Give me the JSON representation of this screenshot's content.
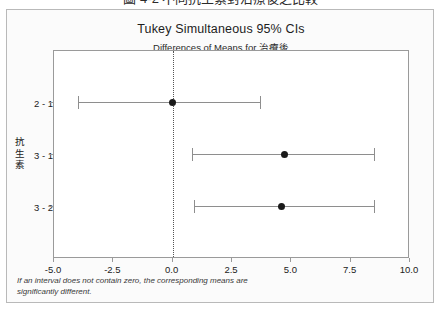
{
  "top_caption": "圖 4-2  不同抗生素對治療後之比較",
  "chart": {
    "title": "Tukey Simultaneous 95% CIs",
    "subtitle": "Differences of Means for 治療後",
    "y_axis_title": "抗生素",
    "footnote_line1": "If an interval does not contain zero, the corresponding means are",
    "footnote_line2": "significantly different.",
    "colors": {
      "point": "#1a1a1a",
      "interval": "#8e8e8e",
      "frame": "#9a9a9a",
      "zero_line": "#555555",
      "panel_background": "#fbfbfb"
    }
  },
  "chart_data": {
    "type": "scatter",
    "title": "Tukey Simultaneous 95% CIs",
    "subtitle": "Differences of Means for 治療後",
    "xlabel": "",
    "ylabel": "抗生素",
    "xlim": [
      -5.0,
      10.0
    ],
    "xticks": [
      "-5.0",
      "-2.5",
      "0.0",
      "2.5",
      "5.0",
      "7.5",
      "10.0"
    ],
    "xtick_values": [
      -5.0,
      -2.5,
      0.0,
      2.5,
      5.0,
      7.5,
      10.0
    ],
    "grid": false,
    "legend": "none",
    "reference_line": 0.0,
    "categories": [
      "2 - 1",
      "3 - 1",
      "3 - 2"
    ],
    "intervals": [
      {
        "label": "2 - 1",
        "lower": -4.0,
        "center": 0.0,
        "upper": 3.7,
        "contains_zero": true
      },
      {
        "label": "3 - 1",
        "lower": 0.8,
        "center": 4.7,
        "upper": 8.5,
        "contains_zero": false
      },
      {
        "label": "3 - 2",
        "lower": 0.9,
        "center": 4.6,
        "upper": 8.5,
        "contains_zero": false
      }
    ],
    "annotations": [
      "If an interval does not contain zero, the corresponding means are",
      "significantly different."
    ]
  }
}
